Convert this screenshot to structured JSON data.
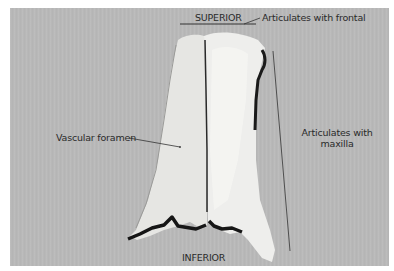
{
  "figure": {
    "colors": {
      "background": "#ffffff",
      "panel": "#b9b9b9",
      "bone": "#e9e9e7",
      "bone_shadow": "#1e1e1e",
      "leader_line": "#333333"
    },
    "labels": {
      "superior": "SUPERIOR",
      "articulates_frontal": "Articulates with frontal",
      "articulates_maxilla_line1": "Articulates with",
      "articulates_maxilla_line2": "maxilla",
      "vascular_foramen": "Vascular foramen",
      "inferior": "INFERIOR"
    }
  }
}
